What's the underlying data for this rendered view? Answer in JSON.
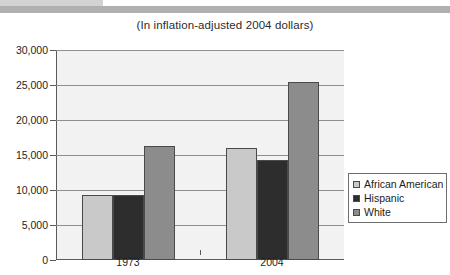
{
  "decor": {
    "band_light_color": "#d3d3d3",
    "band_dark_color": "#b0b0b0"
  },
  "chart_data": {
    "type": "bar",
    "title": "(In inflation-adjusted 2004 dollars)",
    "xlabel": "",
    "ylabel": "",
    "categories": [
      "1973",
      "2004"
    ],
    "series": [
      {
        "name": "African American",
        "values": [
          9300,
          16000
        ],
        "color": "#c9c9c9"
      },
      {
        "name": "Hispanic",
        "values": [
          9300,
          14300
        ],
        "color": "#2d2d2d"
      },
      {
        "name": "White",
        "values": [
          16300,
          25500
        ],
        "color": "#8c8c8c"
      }
    ],
    "ylim": [
      0,
      30000
    ],
    "ytick_values": [
      0,
      5000,
      10000,
      15000,
      20000,
      25000,
      30000
    ],
    "ytick_labels": [
      "0",
      "5,000",
      "10,000",
      "15,000",
      "20,000",
      "25,000",
      "30,000"
    ],
    "grid": true,
    "legend_position": "right",
    "legend_entries": [
      "African American",
      "Hispanic",
      "White"
    ],
    "plot_background": "#f2f2f2",
    "gridline_color": "#8e8e8e",
    "axis_color": "#5a5a5a"
  }
}
